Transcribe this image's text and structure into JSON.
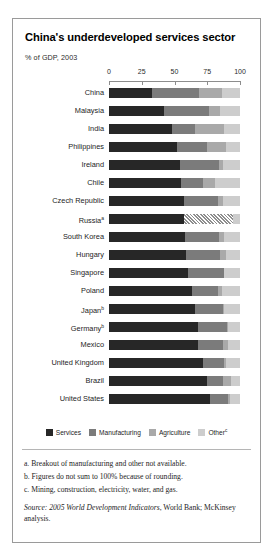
{
  "exhibit": {
    "title": "China's underdeveloped services sector",
    "subtitle": "% of GDP, 2003"
  },
  "legend": {
    "items": [
      {
        "label": "Services",
        "color": "#272727",
        "key": "services"
      },
      {
        "label": "Manufacturing",
        "color": "#7b7b7b",
        "key": "manufacturing"
      },
      {
        "label": "Agriculture",
        "color": "#a9a9a9",
        "key": "agriculture"
      },
      {
        "label": "Other",
        "sup": "c",
        "color": "#cdcdcd",
        "key": "other"
      }
    ]
  },
  "footnotes": [
    "a. Breakout of manufacturing and other not available.",
    "b. Figures do not sum to 100% because of rounding.",
    "c. Mining, construction, electricity, water, and gas."
  ],
  "source": {
    "prefix": "Source:",
    "italic_title": "2005 World Development Indicators",
    "rest": ", World Bank;",
    "line2": "McKinsey analysis."
  },
  "chart_data": {
    "type": "bar",
    "orientation": "horizontal",
    "stacked": true,
    "title": "China's underdeveloped services sector",
    "subtitle": "% of GDP, 2003",
    "xlabel": "% of GDP",
    "ylabel": "",
    "xlim": [
      0,
      100
    ],
    "xticks": [
      0,
      25,
      50,
      75,
      100
    ],
    "xtick_labels": [
      "0",
      "25",
      "50",
      "75",
      "100"
    ],
    "grid": false,
    "legend_position": "bottom",
    "series": [
      {
        "name": "Services",
        "color": "#272727"
      },
      {
        "name": "Manufacturing",
        "color": "#7b7b7b"
      },
      {
        "name": "Agriculture",
        "color": "#a9a9a9"
      },
      {
        "name": "Other",
        "color": "#cdcdcd"
      }
    ],
    "categories": [
      "China",
      "Malaysia",
      "India",
      "Philippines",
      "Ireland",
      "Chile",
      "Czech Republic",
      "Russia",
      "South Korea",
      "Hungary",
      "Singapore",
      "Poland",
      "Japan",
      "Germany",
      "Mexico",
      "United Kingdom",
      "Brazil",
      "United States"
    ],
    "rows": [
      {
        "country": "China",
        "sup": "",
        "services": 33,
        "manufacturing": 36,
        "agriculture": 17,
        "other": 14,
        "unavailable": 0
      },
      {
        "country": "Malaysia",
        "sup": "",
        "services": 42,
        "manufacturing": 34,
        "agriculture": 9,
        "other": 15,
        "unavailable": 0
      },
      {
        "country": "India",
        "sup": "",
        "services": 48,
        "manufacturing": 18,
        "agriculture": 22,
        "other": 12,
        "unavailable": 0
      },
      {
        "country": "Philippines",
        "sup": "",
        "services": 52,
        "manufacturing": 23,
        "agriculture": 14,
        "other": 11,
        "unavailable": 0
      },
      {
        "country": "Ireland",
        "sup": "",
        "services": 54,
        "manufacturing": 30,
        "agriculture": 3,
        "other": 13,
        "unavailable": 0
      },
      {
        "country": "Chile",
        "sup": "",
        "services": 55,
        "manufacturing": 17,
        "agriculture": 9,
        "other": 19,
        "unavailable": 0
      },
      {
        "country": "Czech Republic",
        "sup": "",
        "services": 57,
        "manufacturing": 26,
        "agriculture": 4,
        "other": 13,
        "unavailable": 0
      },
      {
        "country": "Russia",
        "sup": "a",
        "services": 57,
        "manufacturing": 0,
        "agriculture": 0,
        "other": 5,
        "unavailable": 38
      },
      {
        "country": "South Korea",
        "sup": "",
        "services": 58,
        "manufacturing": 26,
        "agriculture": 4,
        "other": 12,
        "unavailable": 0
      },
      {
        "country": "Hungary",
        "sup": "",
        "services": 59,
        "manufacturing": 26,
        "agriculture": 4,
        "other": 11,
        "unavailable": 0
      },
      {
        "country": "Singapore",
        "sup": "",
        "services": 60,
        "manufacturing": 28,
        "agriculture": 0,
        "other": 12,
        "unavailable": 0
      },
      {
        "country": "Poland",
        "sup": "",
        "services": 63,
        "manufacturing": 20,
        "agriculture": 3,
        "other": 14,
        "unavailable": 0
      },
      {
        "country": "Japan",
        "sup": "b",
        "services": 66,
        "manufacturing": 21,
        "agriculture": 1,
        "other": 12,
        "unavailable": 0
      },
      {
        "country": "Germany",
        "sup": "b",
        "services": 68,
        "manufacturing": 22,
        "agriculture": 1,
        "other": 9,
        "unavailable": 0
      },
      {
        "country": "Mexico",
        "sup": "",
        "services": 68,
        "manufacturing": 19,
        "agriculture": 4,
        "other": 9,
        "unavailable": 0
      },
      {
        "country": "United Kingdom",
        "sup": "",
        "services": 72,
        "manufacturing": 16,
        "agriculture": 1,
        "other": 11,
        "unavailable": 0
      },
      {
        "country": "Brazil",
        "sup": "",
        "services": 75,
        "manufacturing": 12,
        "agriculture": 6,
        "other": 7,
        "unavailable": 0
      },
      {
        "country": "United States",
        "sup": "",
        "services": 77,
        "manufacturing": 14,
        "agriculture": 1,
        "other": 8,
        "unavailable": 0
      }
    ]
  }
}
